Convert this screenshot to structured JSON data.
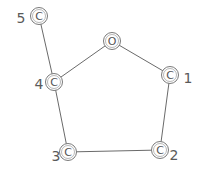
{
  "diagram": {
    "type": "molecular-structure",
    "style": "hand-drawn",
    "stroke_color": "#6a6a6a",
    "atoms": [
      {
        "id": "O",
        "symbol": "O",
        "index_label": ""
      },
      {
        "id": "C1",
        "symbol": "C",
        "index_label": "1"
      },
      {
        "id": "C2",
        "symbol": "C",
        "index_label": "2"
      },
      {
        "id": "C3",
        "symbol": "C",
        "index_label": "3"
      },
      {
        "id": "C4",
        "symbol": "C",
        "index_label": "4"
      },
      {
        "id": "C5",
        "symbol": "C",
        "index_label": "5"
      }
    ],
    "bonds": [
      {
        "from": "O",
        "to": "C1"
      },
      {
        "from": "C1",
        "to": "C2"
      },
      {
        "from": "C2",
        "to": "C3"
      },
      {
        "from": "C3",
        "to": "C4"
      },
      {
        "from": "C4",
        "to": "O"
      },
      {
        "from": "C4",
        "to": "C5"
      }
    ]
  }
}
